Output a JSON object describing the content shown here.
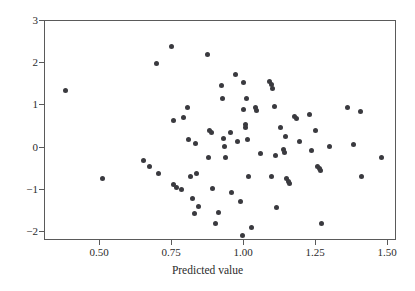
{
  "chart_data": {
    "type": "scatter",
    "title": "",
    "xlabel": "Predicted value",
    "ylabel": "",
    "xlim": [
      0.33,
      1.555
    ],
    "ylim": [
      -2.25,
      3.0
    ],
    "grid": false,
    "legend": null,
    "marker": {
      "shape": "circle",
      "color": "#3a3a3f",
      "size": 5
    },
    "xticks": [
      {
        "value": 0.5,
        "label": "0.50"
      },
      {
        "value": 0.75,
        "label": "0.75"
      },
      {
        "value": 1.0,
        "label": "1.00"
      },
      {
        "value": 1.25,
        "label": "1.25"
      },
      {
        "value": 1.5,
        "label": "1.50"
      }
    ],
    "yticks": [
      {
        "value": 3,
        "label": "3"
      },
      {
        "value": 2,
        "label": "2"
      },
      {
        "value": 1,
        "label": "1"
      },
      {
        "value": 0,
        "label": "0"
      },
      {
        "value": -1,
        "label": "−1"
      },
      {
        "value": -2,
        "label": "−2"
      }
    ],
    "points": [
      [
        0.385,
        1.32
      ],
      [
        0.512,
        -0.76
      ],
      [
        0.655,
        -0.33
      ],
      [
        0.676,
        -0.46
      ],
      [
        0.7,
        1.97
      ],
      [
        0.706,
        -0.63
      ],
      [
        0.752,
        2.38
      ],
      [
        0.757,
        0.61
      ],
      [
        0.76,
        -0.9
      ],
      [
        0.768,
        -0.96
      ],
      [
        0.787,
        -1.01
      ],
      [
        0.793,
        0.68
      ],
      [
        0.806,
        0.93
      ],
      [
        0.812,
        0.18
      ],
      [
        0.818,
        -0.71
      ],
      [
        0.824,
        -1.24
      ],
      [
        0.83,
        -1.59
      ],
      [
        0.836,
        0.07
      ],
      [
        0.84,
        -0.64
      ],
      [
        0.847,
        -1.42
      ],
      [
        0.876,
        2.19
      ],
      [
        0.88,
        -0.26
      ],
      [
        0.885,
        0.39
      ],
      [
        0.89,
        0.34
      ],
      [
        0.894,
        -1.0
      ],
      [
        0.904,
        -1.83
      ],
      [
        0.915,
        -1.55
      ],
      [
        0.926,
        1.44
      ],
      [
        0.93,
        1.15
      ],
      [
        0.932,
        0.2
      ],
      [
        0.936,
        0.01
      ],
      [
        0.938,
        -0.27
      ],
      [
        0.955,
        0.34
      ],
      [
        0.96,
        -1.09
      ],
      [
        0.975,
        1.72
      ],
      [
        0.982,
        0.11
      ],
      [
        0.993,
        -1.31
      ],
      [
        0.997,
        -2.1
      ],
      [
        1.0,
        1.52
      ],
      [
        1.003,
        0.89
      ],
      [
        1.007,
        0.53
      ],
      [
        1.01,
        0.46
      ],
      [
        1.012,
        1.13
      ],
      [
        1.015,
        0.18
      ],
      [
        1.018,
        -0.72
      ],
      [
        1.03,
        -1.92
      ],
      [
        1.042,
        0.92
      ],
      [
        1.048,
        0.85
      ],
      [
        1.06,
        -0.17
      ],
      [
        1.092,
        1.55
      ],
      [
        1.098,
        1.47
      ],
      [
        1.104,
        1.38
      ],
      [
        1.1,
        -0.72
      ],
      [
        1.108,
        0.94
      ],
      [
        1.112,
        -0.21
      ],
      [
        1.116,
        -1.44
      ],
      [
        1.13,
        0.45
      ],
      [
        1.14,
        -0.07
      ],
      [
        1.144,
        -0.13
      ],
      [
        1.148,
        0.25
      ],
      [
        1.152,
        -0.76
      ],
      [
        1.158,
        -0.82
      ],
      [
        1.163,
        -0.88
      ],
      [
        1.18,
        0.72
      ],
      [
        1.186,
        0.66
      ],
      [
        1.196,
        0.13
      ],
      [
        1.23,
        0.76
      ],
      [
        1.237,
        -0.09
      ],
      [
        1.25,
        0.37
      ],
      [
        1.258,
        -0.47
      ],
      [
        1.264,
        -0.52
      ],
      [
        1.27,
        -0.57
      ],
      [
        1.272,
        -1.83
      ],
      [
        1.3,
        0.01
      ],
      [
        1.362,
        0.92
      ],
      [
        1.382,
        0.05
      ],
      [
        1.408,
        0.84
      ],
      [
        1.412,
        -0.7
      ],
      [
        1.482,
        -0.25
      ]
    ]
  }
}
